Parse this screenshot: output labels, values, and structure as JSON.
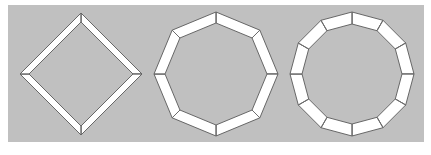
{
  "figure": {
    "background_color": "#ffffff",
    "panel": {
      "name": "gray-panel",
      "color": "#c0c0c0",
      "x": 8,
      "y": 5,
      "width": 416,
      "height": 137
    },
    "band_fill_color": "#ffffff",
    "band_stroke_color": "#595959",
    "spoke_color": "#6e6e6e",
    "shapes": [
      {
        "label": "square-annulus",
        "sides": 4,
        "center_x": 81,
        "center_y": 74,
        "outer_radius": 61,
        "inner_radius": 52,
        "rotation_deg": -90
      },
      {
        "label": "octagon-annulus",
        "sides": 8,
        "center_x": 216,
        "center_y": 74,
        "outer_radius": 62,
        "inner_radius": 51,
        "rotation_deg": -90
      },
      {
        "label": "dodecagon-annulus",
        "sides": 12,
        "center_x": 352,
        "center_y": 74,
        "outer_radius": 62,
        "inner_radius": 50,
        "rotation_deg": -90
      }
    ]
  }
}
